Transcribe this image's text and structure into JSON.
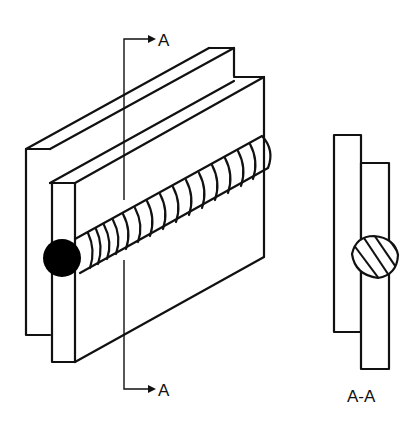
{
  "diagram": {
    "type": "technical-drawing",
    "section_marker_top": "A",
    "section_marker_bottom": "A",
    "section_view_label": "A-A",
    "colors": {
      "line": "#111111",
      "background": "#ffffff",
      "weld_end": "#000000"
    }
  }
}
